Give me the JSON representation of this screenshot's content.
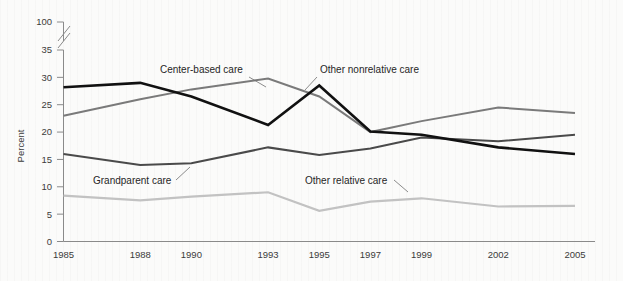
{
  "chart_data": {
    "type": "line",
    "title": "",
    "xlabel": "",
    "ylabel": "Percent",
    "categories": [
      "1985",
      "1988",
      "1990",
      "1993",
      "1995",
      "1997",
      "1999",
      "2002",
      "2005"
    ],
    "x_numeric": [
      1985,
      1988,
      1990,
      1993,
      1995,
      1997,
      1999,
      2002,
      2005
    ],
    "ylim": [
      0,
      35
    ],
    "y_ticks": [
      0,
      5,
      10,
      15,
      20,
      25,
      30,
      35,
      100
    ],
    "y_axis_break": {
      "between": [
        35,
        100
      ],
      "style": "double-slash"
    },
    "grid": false,
    "legend": "inline-annotations",
    "series": [
      {
        "name": "Center-based care",
        "color": "#7a7a7a",
        "values": [
          23.0,
          26.0,
          27.8,
          29.8,
          26.5,
          20.0,
          22.0,
          24.5,
          23.5
        ]
      },
      {
        "name": "Other nonrelative care",
        "color": "#111111",
        "values": [
          28.2,
          29.0,
          26.5,
          21.3,
          28.5,
          20.1,
          19.5,
          17.2,
          16.0
        ]
      },
      {
        "name": "Grandparent care",
        "color": "#4a4a4a",
        "values": [
          16.0,
          14.0,
          14.3,
          17.2,
          15.8,
          17.0,
          19.0,
          18.3,
          19.5
        ]
      },
      {
        "name": "Other relative care",
        "color": "#c2c2c2",
        "values": [
          8.4,
          7.5,
          8.2,
          9.0,
          5.6,
          7.3,
          7.9,
          6.4,
          6.5
        ]
      }
    ],
    "annotations": [
      {
        "text": "Center-based care",
        "label_x": 160,
        "label_y": 73,
        "leader": [
          [
            249,
            77
          ],
          [
            266,
            87
          ]
        ]
      },
      {
        "text": "Other nonrelative care",
        "label_x": 320,
        "label_y": 73,
        "leader": [
          [
            317,
            77
          ],
          [
            305,
            90
          ]
        ]
      },
      {
        "text": "Grandparent care",
        "label_x": 93,
        "label_y": 184,
        "leader": [
          [
            176,
            180
          ],
          [
            190,
            167
          ]
        ]
      },
      {
        "text": "Other relative care",
        "label_x": 305,
        "label_y": 184,
        "leader": [
          [
            394,
            180
          ],
          [
            408,
            192
          ]
        ]
      }
    ]
  },
  "axis": {
    "y_title": "Percent",
    "y_tick_labels": [
      "0",
      "5",
      "10",
      "15",
      "20",
      "25",
      "30",
      "35",
      "100"
    ],
    "x_tick_labels": [
      "1985",
      "1988",
      "1990",
      "1993",
      "1995",
      "1997",
      "1999",
      "2002",
      "2005"
    ]
  },
  "colors": {
    "background": "#fbfbfa",
    "axis": "#8a8a8a",
    "text": "#3b3b3b",
    "center_based": "#7a7a7a",
    "other_nonrelative": "#111111",
    "grandparent": "#4a4a4a",
    "other_relative": "#c2c2c2"
  }
}
